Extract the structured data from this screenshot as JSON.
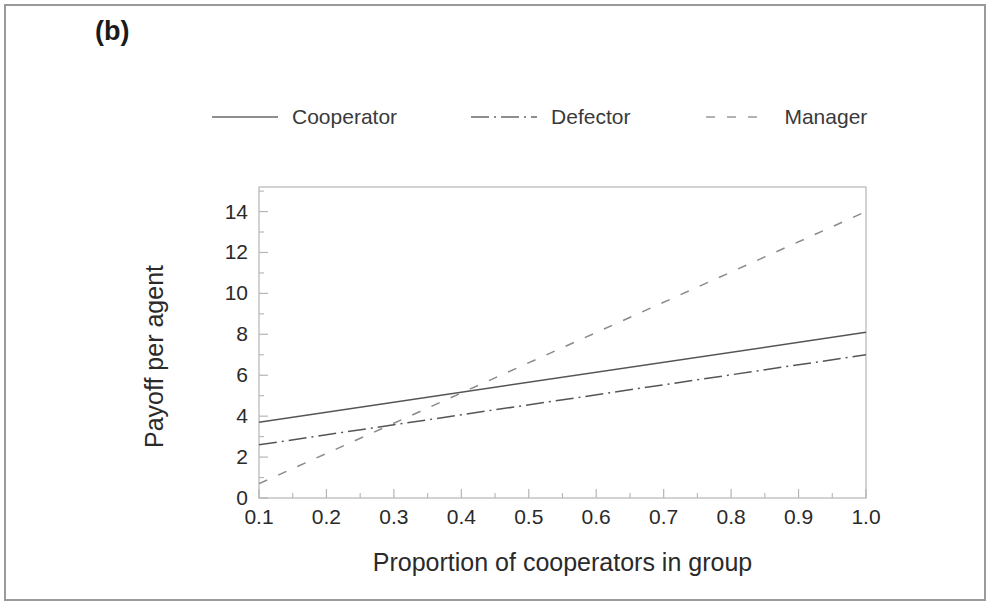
{
  "figure": {
    "panel_label": "(b)",
    "background_color": "#ffffff",
    "border_color": "#9a9a9a"
  },
  "chart_data": {
    "type": "line",
    "title": "",
    "subtitle": "",
    "panel": "(b)",
    "xlabel": "Proportion of cooperators in group",
    "ylabel": "Payoff per agent",
    "xlim": [
      0.1,
      1.0
    ],
    "ylim": [
      0,
      15.2
    ],
    "xticks": [
      0.1,
      0.2,
      0.3,
      0.4,
      0.5,
      0.6,
      0.7,
      0.8,
      0.9,
      1.0
    ],
    "xtick_labels": [
      "0.1",
      "0.2",
      "0.3",
      "0.4",
      "0.5",
      "0.6",
      "0.7",
      "0.8",
      "0.9",
      "1.0"
    ],
    "yticks": [
      0,
      2,
      4,
      6,
      8,
      10,
      12,
      14
    ],
    "ytick_labels": [
      "0",
      "2",
      "4",
      "6",
      "8",
      "10",
      "12",
      "14"
    ],
    "minor_ticks": true,
    "grid": false,
    "legend_position": "top",
    "x": [
      0.1,
      1.0
    ],
    "series": [
      {
        "name": "Cooperator",
        "linestyle": "solid",
        "color": "#555555",
        "values": [
          3.7,
          8.1
        ]
      },
      {
        "name": "Defector",
        "linestyle": "dashdot",
        "color": "#555555",
        "values": [
          2.6,
          7.0
        ]
      },
      {
        "name": "Manager",
        "linestyle": "dashed",
        "color": "#8a8a8a",
        "values": [
          0.7,
          14.0
        ]
      }
    ],
    "annotations": []
  },
  "legend": {
    "items": [
      {
        "label": "Cooperator",
        "swatch": "solid-line-swatch"
      },
      {
        "label": "Defector",
        "swatch": "dashdot-line-swatch"
      },
      {
        "label": "Manager",
        "swatch": "dashed-line-swatch"
      }
    ]
  },
  "axes": {
    "y_title": "Payoff per agent",
    "x_title": "Proportion of cooperators in group"
  }
}
